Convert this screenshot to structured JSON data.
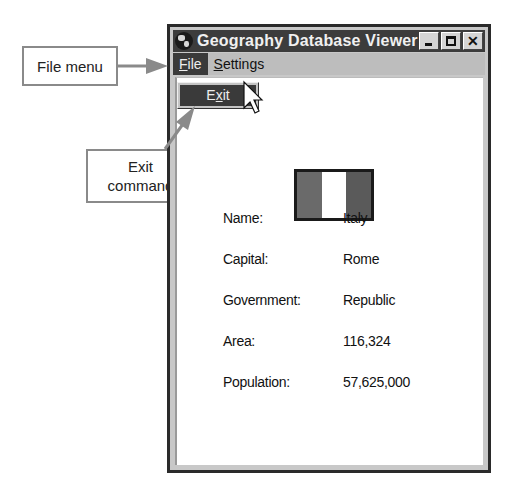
{
  "callouts": {
    "file_menu": "File menu",
    "exit_command_line1": "Exit",
    "exit_command_line2": "command"
  },
  "window": {
    "title": "Geography Database Viewer",
    "title_icon": "globe-icon",
    "controls": [
      "minimize",
      "maximize",
      "close"
    ],
    "close_glyph": "✕"
  },
  "menubar": {
    "items": [
      {
        "label_mnemonic": "F",
        "label_rest": "ile",
        "active": true
      },
      {
        "label_mnemonic": "S",
        "label_rest": "ettings",
        "active": false
      }
    ]
  },
  "file_menu": {
    "items": [
      {
        "label_pre": "E",
        "label_mnemonic": "x",
        "label_post": "it",
        "highlighted": true
      }
    ]
  },
  "flag": {
    "country": "Italy",
    "stripes": [
      "#6a6a6a",
      "#ffffff",
      "#5a5a5a"
    ]
  },
  "record": {
    "fields": [
      {
        "label": "Name:",
        "value": "Italy"
      },
      {
        "label": "Capital:",
        "value": "Rome"
      },
      {
        "label": "Government:",
        "value": "Republic"
      },
      {
        "label": "Area:",
        "value": "116,324"
      },
      {
        "label": "Population:",
        "value": "57,625,000"
      }
    ]
  },
  "colors": {
    "titlebar": "#3c3c3c",
    "menu_highlight": "#3a3a3a",
    "callout_border": "#8a8a8a",
    "arrow": "#8a8a8a"
  }
}
